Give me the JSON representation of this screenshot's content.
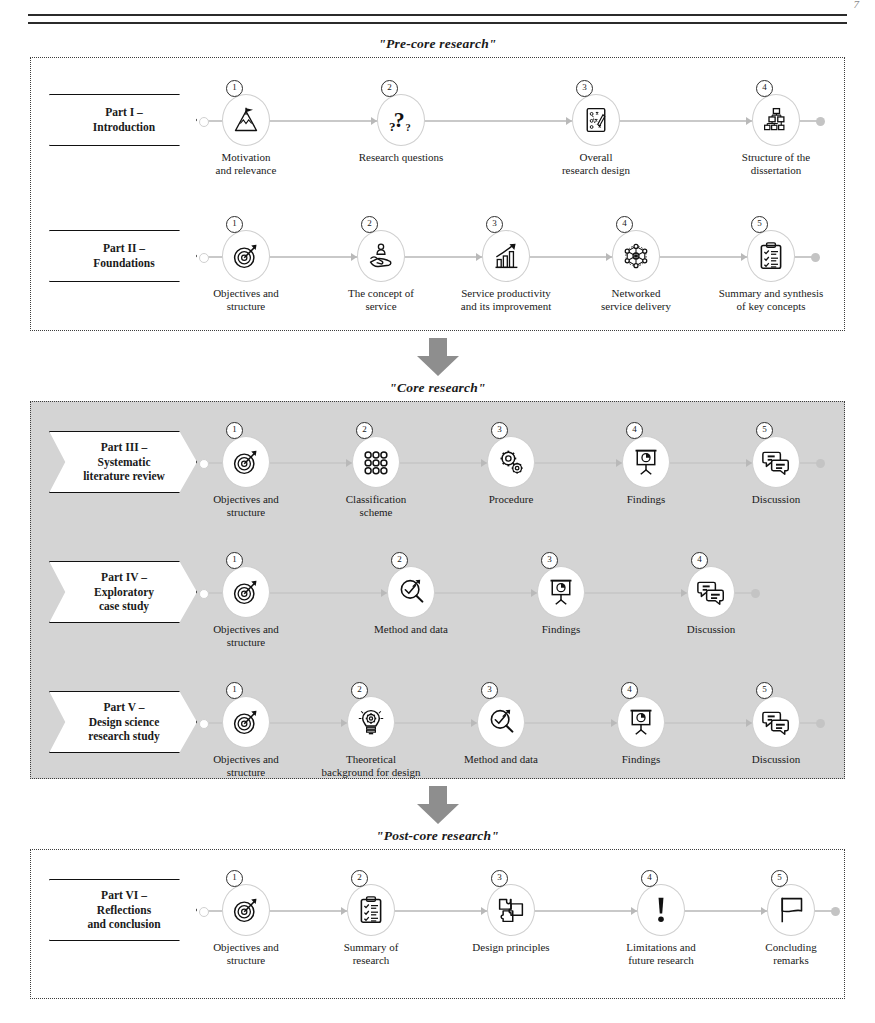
{
  "page": {
    "page_number": "7",
    "document_type": "dissertation-structure-diagram"
  },
  "sections": [
    {
      "id": "pre-core",
      "title": "\"Pre-core research\"",
      "shaded": false,
      "rows": [
        {
          "part_label": "Part I –\nIntroduction",
          "steps": [
            {
              "num": "1",
              "icon": "mountain-flag-icon",
              "caption": "Motivation\nand relevance"
            },
            {
              "num": "2",
              "icon": "question-marks-icon",
              "caption": "Research questions"
            },
            {
              "num": "3",
              "icon": "strategy-playbook-icon",
              "caption": "Overall\nresearch design"
            },
            {
              "num": "4",
              "icon": "hierarchy-tree-icon",
              "caption": "Structure of the\ndissertation"
            }
          ]
        },
        {
          "part_label": "Part II –\nFoundations",
          "steps": [
            {
              "num": "1",
              "icon": "target-arrow-icon",
              "caption": "Objectives and\nstructure"
            },
            {
              "num": "2",
              "icon": "hand-person-service-icon",
              "caption": "The concept of\nservice"
            },
            {
              "num": "3",
              "icon": "growth-chart-icon",
              "caption": "Service productivity\nand its improvement"
            },
            {
              "num": "4",
              "icon": "network-nodes-icon",
              "caption": "Networked\nservice delivery"
            },
            {
              "num": "5",
              "icon": "clipboard-checklist-icon",
              "caption": "Summary and synthesis\nof key concepts"
            }
          ]
        }
      ]
    },
    {
      "id": "core",
      "title": "\"Core research\"",
      "shaded": true,
      "rows": [
        {
          "part_label": "Part III –\nSystematic\nliterature review",
          "steps": [
            {
              "num": "1",
              "icon": "target-arrow-icon",
              "caption": "Objectives and\nstructure"
            },
            {
              "num": "2",
              "icon": "classification-dots-icon",
              "caption": "Classification\nscheme"
            },
            {
              "num": "3",
              "icon": "gears-icon",
              "caption": "Procedure"
            },
            {
              "num": "4",
              "icon": "presentation-chart-icon",
              "caption": "Findings"
            },
            {
              "num": "5",
              "icon": "speech-bubbles-icon",
              "caption": "Discussion"
            }
          ]
        },
        {
          "part_label": "Part IV –\nExploratory\ncase study",
          "steps": [
            {
              "num": "1",
              "icon": "target-arrow-icon",
              "caption": "Objectives and\nstructure"
            },
            {
              "num": "2",
              "icon": "magnifier-check-icon",
              "caption": "Method and data"
            },
            {
              "num": "3",
              "icon": "presentation-chart-icon",
              "caption": "Findings"
            },
            {
              "num": "4",
              "icon": "speech-bubbles-icon",
              "caption": "Discussion"
            }
          ]
        },
        {
          "part_label": "Part V –\nDesign science\nresearch study",
          "steps": [
            {
              "num": "1",
              "icon": "target-arrow-icon",
              "caption": "Objectives and\nstructure"
            },
            {
              "num": "2",
              "icon": "lightbulb-gear-icon",
              "caption": "Theoretical\nbackground for design"
            },
            {
              "num": "3",
              "icon": "magnifier-check-icon",
              "caption": "Method and data"
            },
            {
              "num": "4",
              "icon": "presentation-chart-icon",
              "caption": "Findings"
            },
            {
              "num": "5",
              "icon": "speech-bubbles-icon",
              "caption": "Discussion"
            }
          ]
        }
      ]
    },
    {
      "id": "post-core",
      "title": "\"Post-core research\"",
      "shaded": false,
      "rows": [
        {
          "part_label": "Part VI –\nReflections\nand conclusion",
          "steps": [
            {
              "num": "1",
              "icon": "target-arrow-icon",
              "caption": "Objectives and\nstructure"
            },
            {
              "num": "2",
              "icon": "clipboard-checklist-icon",
              "caption": "Summary of\nresearch"
            },
            {
              "num": "3",
              "icon": "puzzle-pieces-icon",
              "caption": "Design principles"
            },
            {
              "num": "4",
              "icon": "exclamation-mark-icon",
              "caption": "Limitations and\nfuture research"
            },
            {
              "num": "5",
              "icon": "flag-icon",
              "caption": "Concluding\nremarks"
            }
          ]
        }
      ]
    }
  ],
  "connectors": [
    {
      "name": "pre-core-to-core",
      "icon": "down-arrow-icon"
    },
    {
      "name": "core-to-post-core",
      "icon": "down-arrow-icon"
    }
  ],
  "colors": {
    "shaded_background": "#d4d4d4",
    "track": "#c9c9c9",
    "outline": "#111111",
    "arrow_fill": "#8e8e8e"
  }
}
